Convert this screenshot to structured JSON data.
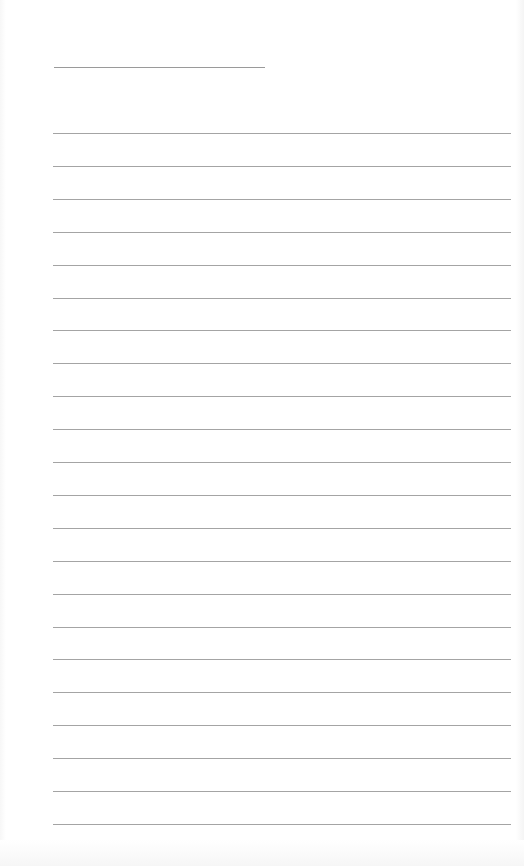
{
  "page": {
    "type": "lined-paper",
    "background_color": "#ffffff",
    "line_color": "#a4a4a4"
  },
  "title_line": {
    "x": 54,
    "y": 67,
    "width": 211
  },
  "rules": {
    "count": 22,
    "first_y": 133,
    "spacing": 32.9,
    "x": 53,
    "width": 458
  }
}
